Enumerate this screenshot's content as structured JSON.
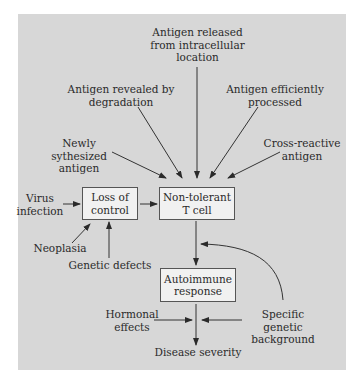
{
  "diagram": {
    "nodes": {
      "antigen_released": "Antigen released\nfrom intracellular\nlocation",
      "antigen_revealed": "Antigen revealed by\ndegradation",
      "antigen_processed": "Antigen efficiently\nprocessed",
      "newly_synthesized": "Newly sythesized\nantigen",
      "cross_reactive": "Cross-reactive\nantigen",
      "virus_infection": "Virus\ninfection",
      "loss_of_control": "Loss of\ncontrol",
      "non_tolerant_t_cell": "Non-tolerant\nT cell",
      "neoplasia": "Neoplasia",
      "genetic_defects": "Genetic defects",
      "autoimmune_response": "Autoimmune\nresponse",
      "hormonal_effects": "Hormonal\neffects",
      "specific_genetic_background": "Specific genetic\nbackground",
      "disease_severity": "Disease severity"
    },
    "edges": [
      {
        "from": "antigen_released",
        "to": "non_tolerant_t_cell"
      },
      {
        "from": "antigen_revealed",
        "to": "non_tolerant_t_cell"
      },
      {
        "from": "antigen_processed",
        "to": "non_tolerant_t_cell"
      },
      {
        "from": "newly_synthesized",
        "to": "non_tolerant_t_cell"
      },
      {
        "from": "cross_reactive",
        "to": "non_tolerant_t_cell"
      },
      {
        "from": "virus_infection",
        "to": "loss_of_control"
      },
      {
        "from": "loss_of_control",
        "to": "non_tolerant_t_cell"
      },
      {
        "from": "neoplasia",
        "to": "loss_of_control"
      },
      {
        "from": "genetic_defects",
        "to": "loss_of_control"
      },
      {
        "from": "non_tolerant_t_cell",
        "to": "autoimmune_response"
      },
      {
        "from": "specific_genetic_background",
        "to": "non_tolerant_t_cell-autoimmune_response link"
      },
      {
        "from": "autoimmune_response",
        "to": "disease_severity"
      },
      {
        "from": "hormonal_effects",
        "to": "disease_severity"
      },
      {
        "from": "specific_genetic_background",
        "to": "disease_severity"
      }
    ]
  }
}
